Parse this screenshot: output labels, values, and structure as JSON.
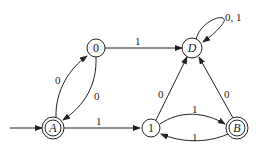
{
  "diagram": {
    "type": "finite-automaton",
    "states": [
      {
        "id": "A",
        "label": "A",
        "start": true,
        "accepting": true
      },
      {
        "id": "0",
        "label": "0",
        "start": false,
        "accepting": false
      },
      {
        "id": "D",
        "label": "D",
        "start": false,
        "accepting": false
      },
      {
        "id": "1",
        "label": "1",
        "start": false,
        "accepting": false
      },
      {
        "id": "B",
        "label": "B",
        "start": false,
        "accepting": true
      }
    ],
    "transitions": [
      {
        "from": "A",
        "to": "0",
        "label": "0"
      },
      {
        "from": "0",
        "to": "A",
        "label": "0"
      },
      {
        "from": "0",
        "to": "D",
        "label": "1"
      },
      {
        "from": "A",
        "to": "1",
        "label": "1"
      },
      {
        "from": "1",
        "to": "D",
        "label": "0"
      },
      {
        "from": "1",
        "to": "B",
        "label": "1"
      },
      {
        "from": "B",
        "to": "1",
        "label": "1"
      },
      {
        "from": "B",
        "to": "D",
        "label": "0"
      },
      {
        "from": "D",
        "to": "D",
        "label": "0, 1"
      }
    ]
  }
}
